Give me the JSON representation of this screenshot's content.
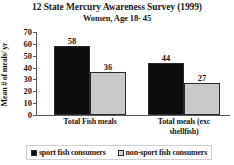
{
  "chart_data": {
    "type": "bar",
    "title": "12 State Mercury Awareness Survey (1999)",
    "subtitle": "Women, Age 18- 45",
    "xlabel": "",
    "ylabel": "Mean # of meals/ yr",
    "ylim": [
      0,
      70
    ],
    "ytick_step": 10,
    "yticks": [
      70,
      60,
      50,
      40,
      30,
      20,
      10,
      0
    ],
    "grid": false,
    "legend_position": "bottom",
    "categories": [
      "Total Fish meals",
      "Total meals (exc shellfish)"
    ],
    "category_labels_wrapped": [
      [
        "Total Fish meals"
      ],
      [
        "Total meals (exc",
        "shellfish)"
      ]
    ],
    "series": [
      {
        "name": "sport fish consumers",
        "color": "#0d0d0d",
        "values": [
          58,
          44
        ]
      },
      {
        "name": "non-sport fish consumers",
        "color": "#c9c9c9",
        "values": [
          36,
          27
        ]
      }
    ]
  }
}
